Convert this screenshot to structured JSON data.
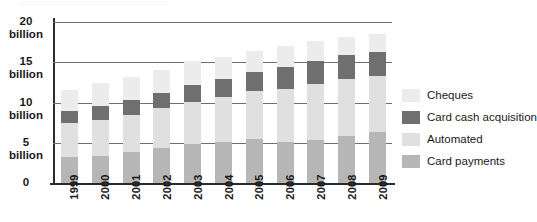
{
  "chart_data": {
    "type": "bar",
    "subtype": "stacked-column",
    "title": "",
    "xlabel": "",
    "ylabel": "",
    "ylim": [
      0,
      20
    ],
    "yunit": "billion",
    "grid": true,
    "legend_position": "right",
    "categories": [
      "1999",
      "2000",
      "2001",
      "2002",
      "2003",
      "2004",
      "2005",
      "2006",
      "2007",
      "2008",
      "2009"
    ],
    "ytick_labels": [
      {
        "num": "20",
        "unit": "billion",
        "value": 20
      },
      {
        "num": "15",
        "unit": "billion",
        "value": 15
      },
      {
        "num": "10",
        "unit": "billion",
        "value": 10
      },
      {
        "num": "5",
        "unit": "billion",
        "value": 5
      },
      {
        "num": "0",
        "unit": "",
        "value": 0
      }
    ],
    "series": [
      {
        "name": "Card payments",
        "color": "#b6b6b6",
        "values": [
          3.2,
          3.4,
          3.9,
          4.4,
          4.8,
          5.1,
          5.5,
          5.1,
          5.4,
          5.9,
          6.3
        ]
      },
      {
        "name": "Automated",
        "color": "#e0e0e0",
        "values": [
          4.2,
          4.4,
          4.5,
          4.9,
          5.3,
          5.6,
          5.9,
          6.6,
          6.9,
          7.0,
          7.0
        ]
      },
      {
        "name": "Card cash acquisition",
        "color": "#6f6f6f",
        "values": [
          1.6,
          1.8,
          1.9,
          1.9,
          2.1,
          2.2,
          2.4,
          2.7,
          2.8,
          3.0,
          3.0
        ]
      },
      {
        "name": "Cheques",
        "color": "#ececec",
        "values": [
          2.6,
          2.8,
          2.9,
          2.9,
          2.9,
          2.8,
          2.6,
          2.6,
          2.5,
          2.3,
          2.2
        ]
      }
    ],
    "stack_order_bottom_to_top": [
      "Card payments",
      "Automated",
      "Card cash acquisition",
      "Cheques"
    ],
    "totals": [
      11.6,
      12.4,
      13.2,
      14.1,
      15.1,
      15.7,
      16.4,
      17.0,
      17.6,
      18.2,
      18.5
    ]
  },
  "legend": {
    "items": [
      {
        "label": "Cheques",
        "color": "#ececec",
        "swatch": "legend-swatch-cheques"
      },
      {
        "label": "Card cash acquisition",
        "color": "#6f6f6f",
        "swatch": "legend-swatch-card-cash-acquisition"
      },
      {
        "label": "Automated",
        "color": "#e0e0e0",
        "swatch": "legend-swatch-automated"
      },
      {
        "label": "Card payments",
        "color": "#b6b6b6",
        "swatch": "legend-swatch-card-payments"
      }
    ]
  }
}
